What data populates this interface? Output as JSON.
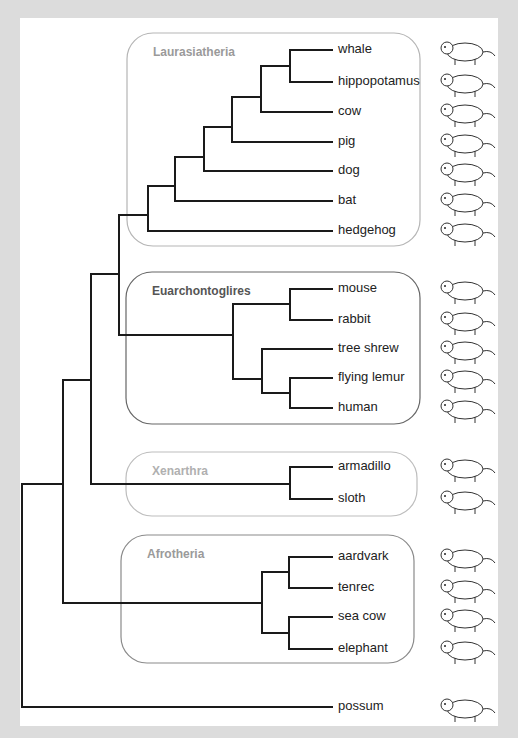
{
  "diagram": {
    "type": "phylogenetic-tree",
    "clades": [
      {
        "id": "laurasiatheria",
        "label": "Laurasiatheria",
        "label_color": "#9a9a9a",
        "border_color": "#b5b5b5",
        "box": [
          127,
          33,
          420,
          246
        ]
      },
      {
        "id": "euarchontoglires",
        "label": "Euarchontoglires",
        "label_color": "#555555",
        "border_color": "#666666",
        "box": [
          126,
          272,
          420,
          424
        ]
      },
      {
        "id": "xenarthra",
        "label": "Xenarthra",
        "label_color": "#b0b0b0",
        "border_color": "#bdbdbd",
        "box": [
          126,
          452,
          417,
          516
        ]
      },
      {
        "id": "afrotheria",
        "label": "Afrotheria",
        "label_color": "#9a9a9a",
        "border_color": "#8a8a8a",
        "box": [
          121,
          535,
          414,
          663
        ]
      }
    ],
    "leaves": [
      {
        "name": "whale",
        "y": 50,
        "clade": "laurasiatheria",
        "icon": "whale-icon"
      },
      {
        "name": "hippopotamus",
        "y": 82,
        "clade": "laurasiatheria",
        "icon": "hippopotamus-icon"
      },
      {
        "name": "cow",
        "y": 112,
        "clade": "laurasiatheria",
        "icon": "cow-icon"
      },
      {
        "name": "pig",
        "y": 142,
        "clade": "laurasiatheria",
        "icon": "pig-icon"
      },
      {
        "name": "dog",
        "y": 171,
        "clade": "laurasiatheria",
        "icon": "dog-icon"
      },
      {
        "name": "bat",
        "y": 201,
        "clade": "laurasiatheria",
        "icon": "bat-icon"
      },
      {
        "name": "hedgehog",
        "y": 231,
        "clade": "laurasiatheria",
        "icon": "hedgehog-icon"
      },
      {
        "name": "mouse",
        "y": 289,
        "clade": "euarchontoglires",
        "icon": "mouse-icon"
      },
      {
        "name": "rabbit",
        "y": 320,
        "clade": "euarchontoglires",
        "icon": "rabbit-icon"
      },
      {
        "name": "tree shrew",
        "y": 349,
        "clade": "euarchontoglires",
        "icon": "tree-shrew-icon"
      },
      {
        "name": "flying lemur",
        "y": 378,
        "clade": "euarchontoglires",
        "icon": "flying-lemur-icon"
      },
      {
        "name": "human",
        "y": 408,
        "clade": "euarchontoglires",
        "icon": "human-baby-icon"
      },
      {
        "name": "armadillo",
        "y": 467,
        "clade": "xenarthra",
        "icon": "armadillo-icon"
      },
      {
        "name": "sloth",
        "y": 499,
        "clade": "xenarthra",
        "icon": "sloth-icon"
      },
      {
        "name": "aardvark",
        "y": 557,
        "clade": "afrotheria",
        "icon": "aardvark-icon"
      },
      {
        "name": "tenrec",
        "y": 588,
        "clade": "afrotheria",
        "icon": "tenrec-icon"
      },
      {
        "name": "sea cow",
        "y": 617,
        "clade": "afrotheria",
        "icon": "sea-cow-icon"
      },
      {
        "name": "elephant",
        "y": 649,
        "clade": "afrotheria",
        "icon": "elephant-icon"
      },
      {
        "name": "possum",
        "y": 707,
        "clade": null,
        "icon": "possum-icon"
      }
    ],
    "branches": [
      [
        22,
        484,
        22,
        707
      ],
      [
        22,
        707,
        332,
        707
      ],
      [
        22,
        484,
        63,
        484
      ],
      [
        63,
        380,
        63,
        603
      ],
      [
        63,
        380,
        91,
        380
      ],
      [
        63,
        603,
        262,
        603
      ],
      [
        91,
        274,
        91,
        484
      ],
      [
        91,
        274,
        119,
        274
      ],
      [
        91,
        484,
        290,
        484
      ],
      [
        119,
        215,
        119,
        335
      ],
      [
        119,
        215,
        148,
        215
      ],
      [
        119,
        335,
        233,
        335
      ],
      [
        148,
        186,
        148,
        231
      ],
      [
        148,
        231,
        332,
        231
      ],
      [
        148,
        186,
        175,
        186
      ],
      [
        175,
        157,
        175,
        201
      ],
      [
        175,
        201,
        332,
        201
      ],
      [
        175,
        157,
        204,
        157
      ],
      [
        204,
        127,
        204,
        171
      ],
      [
        204,
        171,
        332,
        171
      ],
      [
        204,
        127,
        232,
        127
      ],
      [
        232,
        97,
        232,
        142
      ],
      [
        232,
        142,
        332,
        142
      ],
      [
        232,
        97,
        261,
        97
      ],
      [
        261,
        66,
        261,
        112
      ],
      [
        261,
        112,
        332,
        112
      ],
      [
        261,
        66,
        290,
        66
      ],
      [
        290,
        50,
        290,
        82
      ],
      [
        290,
        50,
        332,
        50
      ],
      [
        290,
        82,
        332,
        82
      ],
      [
        233,
        304,
        233,
        379
      ],
      [
        233,
        304,
        290,
        304
      ],
      [
        233,
        379,
        262,
        379
      ],
      [
        290,
        289,
        290,
        320
      ],
      [
        290,
        289,
        332,
        289
      ],
      [
        290,
        320,
        332,
        320
      ],
      [
        262,
        349,
        262,
        393
      ],
      [
        262,
        349,
        332,
        349
      ],
      [
        262,
        393,
        290,
        393
      ],
      [
        290,
        378,
        290,
        408
      ],
      [
        290,
        378,
        332,
        378
      ],
      [
        290,
        408,
        332,
        408
      ],
      [
        290,
        467,
        290,
        499
      ],
      [
        290,
        467,
        332,
        467
      ],
      [
        290,
        499,
        332,
        499
      ],
      [
        262,
        572,
        262,
        633
      ],
      [
        262,
        572,
        289,
        572
      ],
      [
        262,
        633,
        289,
        633
      ],
      [
        289,
        557,
        289,
        588
      ],
      [
        289,
        557,
        332,
        557
      ],
      [
        289,
        588,
        332,
        588
      ],
      [
        289,
        617,
        289,
        649
      ],
      [
        289,
        617,
        332,
        617
      ],
      [
        289,
        649,
        332,
        649
      ]
    ],
    "colors": {
      "background_frame": "#dcdcdc",
      "panel": "#ffffff",
      "branch": "#1a1a1a",
      "leaf_text": "#222222"
    }
  }
}
